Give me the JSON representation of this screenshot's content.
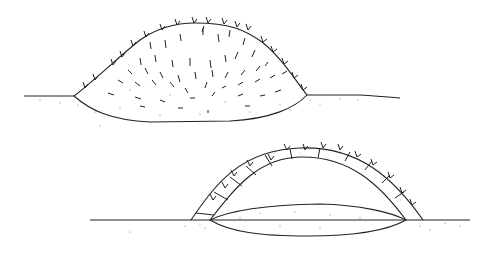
{
  "figures": [
    {
      "name": "solid-mound",
      "description": "Mound cross-section filled with branches and soil"
    },
    {
      "name": "arched-covering",
      "description": "Arched branch-and-soil covering over lens-shaped pit"
    }
  ],
  "colors": {
    "line": "#222222",
    "stipple": "#555555",
    "background": "#ffffff"
  }
}
